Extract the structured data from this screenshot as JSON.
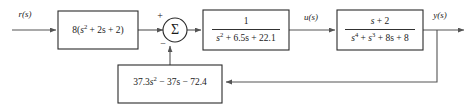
{
  "diagram": {
    "signals": {
      "input": "r(s)",
      "intermediate": "u(s)",
      "output": "y(s)"
    },
    "summing_junction": {
      "symbol": "Σ",
      "input_sign_left": "+",
      "input_sign_bottom": "−"
    },
    "blocks": {
      "prefilter": {
        "expression": "8(s² + 2s + 2)",
        "parts": {
          "gain": "8(",
          "var": "s",
          "exp": "2",
          "rest": " + 2s + 2)"
        }
      },
      "compensator": {
        "expression": "1 / (s² + 6.5s + 22.1)",
        "numerator": "1",
        "denominator_parts": {
          "var": "s",
          "exp": "2",
          "rest": " + 6.5s + 22.1"
        }
      },
      "plant": {
        "expression": "(s + 2) / (s⁴ + s³ + 8s + 8)",
        "numerator_parts": {
          "var": "s",
          "rest": " + 2"
        },
        "denominator_parts": {
          "var1": "s",
          "exp1": "4",
          "mid": " + ",
          "var2": "s",
          "exp2": "3",
          "rest": " + 8s + 8"
        }
      },
      "feedback": {
        "expression": "37.3s² − 37s − 72.4",
        "parts": {
          "coef": "37.3",
          "var": "s",
          "exp": "2",
          "rest": " − 37s − 72.4"
        }
      }
    },
    "colors": {
      "background": "#ffffff",
      "box_stroke": "#2b2b2b",
      "wire": "#545454",
      "text": "#1a1a1a"
    }
  }
}
